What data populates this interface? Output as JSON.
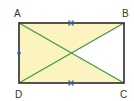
{
  "figure": {
    "type": "rectangle-with-diagonals",
    "vertices": [
      {
        "label": "A",
        "x": 19,
        "y": 23,
        "label_x": 14,
        "label_y": 17
      },
      {
        "label": "B",
        "x": 124,
        "y": 23,
        "label_x": 122,
        "label_y": 17
      },
      {
        "label": "C",
        "x": 124,
        "y": 83,
        "label_x": 120,
        "label_y": 98
      },
      {
        "label": "D",
        "x": 19,
        "y": 83,
        "label_x": 15,
        "label_y": 98
      }
    ],
    "center": {
      "x": 71.5,
      "y": 53
    },
    "shaded_triangles": [
      "ABO",
      "ADO",
      "DCO"
    ],
    "unshaded_triangles": [
      "BCO"
    ],
    "tick_marks": [
      {
        "on_side": "AB",
        "symbol": "×",
        "x": 71,
        "y": 23
      },
      {
        "on_side": "DC",
        "symbol": "×",
        "x": 71,
        "y": 83
      }
    ],
    "point_marks": [
      {
        "on_side": "AD",
        "symbol": "•",
        "x": 19,
        "y": 53
      }
    ],
    "colors": {
      "fill": "#fbf3c0",
      "outline": "#2b2b2b",
      "diagonal": "#3f9a3f",
      "tick": "#3a5fa8",
      "dot": "#2f5aa8",
      "label": "#333333"
    }
  }
}
